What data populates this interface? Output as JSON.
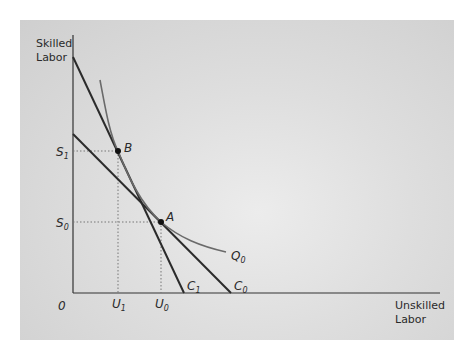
{
  "diagram": {
    "type": "isoquant-isocost",
    "y_axis_label": [
      "Skilled",
      "Labor"
    ],
    "x_axis_label": [
      "Unskilled",
      "Labor"
    ],
    "origin_label": "0",
    "colors": {
      "axis": "#333333",
      "isocost": "#2b2b2b",
      "isoquant": "#6a6a6a",
      "guide": "#777777",
      "point": "#111111"
    },
    "points": [
      {
        "id": "B",
        "label": "B",
        "x_label": {
          "main": "U",
          "sub": "1"
        },
        "y_label": {
          "main": "S",
          "sub": "1"
        }
      },
      {
        "id": "A",
        "label": "A",
        "x_label": {
          "main": "U",
          "sub": "0"
        },
        "y_label": {
          "main": "S",
          "sub": "0"
        }
      }
    ],
    "lines": [
      {
        "id": "C1",
        "main": "C",
        "sub": "1",
        "description": "steeper isocost line tangent at B"
      },
      {
        "id": "C0",
        "main": "C",
        "sub": "0",
        "description": "flatter isocost line tangent at A"
      }
    ],
    "curves": [
      {
        "id": "Q0",
        "main": "Q",
        "sub": "0",
        "description": "isoquant passing through B and A"
      }
    ]
  }
}
